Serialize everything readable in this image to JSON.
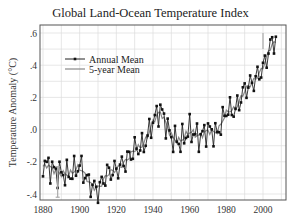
{
  "chart_data": {
    "type": "line",
    "title": "Global Land-Ocean Temperature Index",
    "xlabel": "",
    "ylabel": "Temperature Anomaly (°C)",
    "xlim": [
      1880,
      2010
    ],
    "ylim": [
      -0.45,
      0.65
    ],
    "x_ticks": [
      1880,
      1900,
      1920,
      1940,
      1960,
      1980,
      2000
    ],
    "y_ticks": [
      0.6,
      0.4,
      0.2,
      0.0,
      -0.2,
      -0.4
    ],
    "y_tick_labels": [
      ".6",
      ".4",
      ".2",
      ".0",
      "-.2",
      "-.4"
    ],
    "grid": true,
    "legend": {
      "position": "upper left",
      "entries": [
        "Annual Mean",
        "5-year Mean"
      ]
    },
    "data_note": "Approximate visual trace. Individual annual values are not legible at this resolution; the series reproduces the overall shape of the plotted curve, not the underlying measurements.",
    "key_features": [
      "Starts near -0.2 in 1880",
      "Minimum around -0.4 near 1905–1910",
      "Rises to about +0.1 to +0.2 near 1940–1945",
      "Roughly flat, near 0 to slightly negative, 1950–1975",
      "Rises steeply after about 1976",
      "Peaks near +0.6 in the mid-2000s"
    ],
    "error_bars": [
      {
        "approx_year": 1888,
        "approx_low": -0.42,
        "approx_high": -0.23
      },
      {
        "approx_year": 2000,
        "approx_range": "small, about ±0.05"
      }
    ]
  }
}
